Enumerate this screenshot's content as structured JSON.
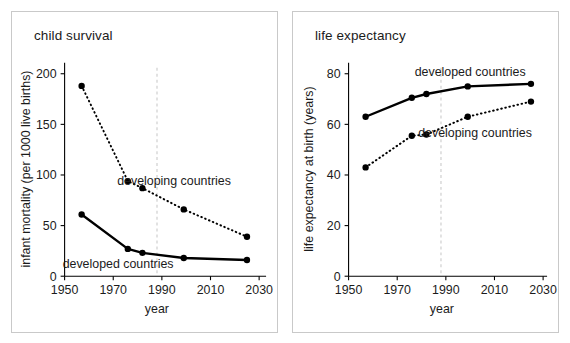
{
  "figure": {
    "background_color": "#ffffff",
    "frame_color": "#c9c9c9",
    "line_color": "#000000",
    "reference_line_color": "#d6d6d6"
  },
  "panels": [
    {
      "id": "child-survival",
      "title": "child survival",
      "series_labels": {
        "developing": "developing countries",
        "developed": "developed countries"
      }
    },
    {
      "id": "life-expectancy",
      "title": "life expectancy",
      "series_labels": {
        "developed": "developed countries",
        "developing": "developing countries"
      }
    }
  ],
  "chart_data": [
    {
      "type": "line",
      "title": "child survival",
      "xlabel": "year",
      "ylabel": "infant mortality (per 1000 live births)",
      "xlim": [
        1950,
        2030
      ],
      "ylim": [
        0,
        200
      ],
      "xticks": [
        1950,
        1970,
        1990,
        2010,
        2030
      ],
      "yticks": [
        0,
        50,
        100,
        150,
        200
      ],
      "grid": false,
      "legend_position": "inline-annotations",
      "annotations": [
        {
          "text": "developing countries",
          "x": 1995,
          "y": 90
        },
        {
          "text": "developed countries",
          "x": 1972,
          "y": 8
        }
      ],
      "reference_line": {
        "x": 1988,
        "style": "dashed",
        "color": "#d6d6d6"
      },
      "x": [
        1957,
        1976,
        1982,
        1999,
        2025
      ],
      "series": [
        {
          "name": "developing countries",
          "style": "dotted",
          "values": [
            188,
            94,
            87,
            66,
            39
          ]
        },
        {
          "name": "developed countries",
          "style": "solid",
          "values": [
            61,
            27,
            23,
            18,
            16
          ]
        }
      ]
    },
    {
      "type": "line",
      "title": "life expectancy",
      "xlabel": "year",
      "ylabel": "life expectancy at birth (years)",
      "xlim": [
        1950,
        2030
      ],
      "ylim": [
        0,
        80
      ],
      "xticks": [
        1950,
        1970,
        1990,
        2010,
        2030
      ],
      "yticks": [
        0,
        20,
        40,
        60,
        80
      ],
      "grid": false,
      "legend_position": "inline-annotations",
      "annotations": [
        {
          "text": "developed countries",
          "x": 2000,
          "y": 79
        },
        {
          "text": "developing countries",
          "x": 2002,
          "y": 55
        }
      ],
      "reference_line": {
        "x": 1988,
        "style": "dashed",
        "color": "#d6d6d6"
      },
      "x": [
        1957,
        1976,
        1982,
        1999,
        2025
      ],
      "series": [
        {
          "name": "developed countries",
          "style": "solid",
          "values": [
            63,
            70.5,
            72,
            75,
            76
          ]
        },
        {
          "name": "developing countries",
          "style": "dotted",
          "values": [
            43,
            55.5,
            56,
            63,
            69
          ]
        }
      ]
    }
  ]
}
